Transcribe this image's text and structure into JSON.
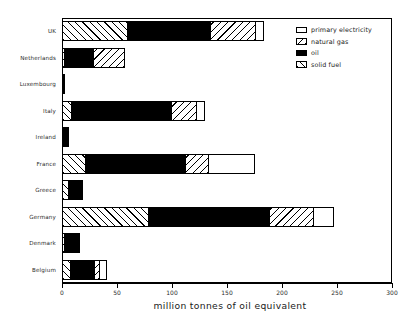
{
  "chart_data": {
    "type": "bar",
    "orientation": "horizontal",
    "stacked": true,
    "title": "",
    "xlabel": "million tonnes of oil equivalent",
    "ylabel": "",
    "xlim": [
      0,
      300
    ],
    "xticks": [
      0,
      50,
      100,
      150,
      200,
      250,
      300
    ],
    "grid": false,
    "legend_position": "top-right",
    "categories": [
      "UK",
      "Netherlands",
      "Luxembourg",
      "Italy",
      "Ireland",
      "France",
      "Greece",
      "Germany",
      "Denmark",
      "Belgium"
    ],
    "series": [
      {
        "name": "solid fuel",
        "values": [
          60,
          3,
          2,
          9,
          2,
          22,
          6,
          79,
          3,
          8
        ]
      },
      {
        "name": "oil",
        "values": [
          76,
          27,
          1,
          92,
          5,
          91,
          14,
          111,
          14,
          23
        ]
      },
      {
        "name": "natural gas",
        "values": [
          42,
          29,
          0,
          23,
          0,
          22,
          0,
          41,
          0,
          5
        ]
      },
      {
        "name": "primary electricity",
        "values": [
          8,
          0,
          0,
          8,
          0,
          43,
          0,
          19,
          0,
          7
        ]
      }
    ],
    "totals": [
      186,
      59,
      3,
      132,
      7,
      178,
      20,
      250,
      17,
      43
    ]
  },
  "legend": {
    "items": [
      {
        "label": "primary electricity",
        "pattern": "elec",
        "swatch_name": "legend-swatch-primary-electricity"
      },
      {
        "label": "natural gas",
        "pattern": "gas",
        "swatch_name": "legend-swatch-natural-gas"
      },
      {
        "label": "oil",
        "pattern": "oil",
        "swatch_name": "legend-swatch-oil"
      },
      {
        "label": "solid fuel",
        "pattern": "solidfuel",
        "swatch_name": "legend-swatch-solid-fuel"
      }
    ]
  },
  "axis": {
    "x_title": "million tonnes of oil equivalent",
    "x_tick_labels": [
      "0",
      "50",
      "100",
      "150",
      "200",
      "250",
      "300"
    ],
    "y_tick_labels": [
      "UK",
      "Netherlands",
      "Luxembourg",
      "Italy",
      "Ireland",
      "France",
      "Greece",
      "Germany",
      "Denmark",
      "Belgium"
    ]
  },
  "colors": {
    "ink": "#000000",
    "background": "#ffffff",
    "oil_fill": "#000000",
    "electricity_fill": "#ffffff"
  }
}
